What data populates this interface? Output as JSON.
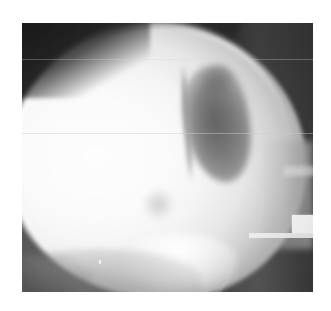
{
  "page": {
    "background_color": "#ffffff",
    "width": 331,
    "height": 311
  },
  "radiograph": {
    "name": "lateral-skull-radiograph",
    "modality": "X-ray",
    "view": "lateral",
    "anatomy": "skull",
    "frame": {
      "left": 22,
      "top": 23,
      "width": 291,
      "height": 269
    },
    "colors": {
      "film_dark": "#3a3a3a",
      "collimation_black": "#1a1a1a",
      "bone_white": "#fdfdfd",
      "lesion_grey": "#6e6e6e",
      "soft_tissue_grey": "#b4b4b4",
      "marker_white": "#f2f2f2"
    },
    "features": [
      {
        "id": "calvarium",
        "label": "Calvarium / cranial vault",
        "description": "Large bright radiopaque dome occupying most of the film"
      },
      {
        "id": "skull-rim",
        "label": "Cortical outer table",
        "description": "Bright curved rim along the superior and anterior skull margin"
      },
      {
        "id": "scalp-line",
        "label": "Scalp soft tissue line",
        "description": "Thin darker line outside the bright cortical rim"
      },
      {
        "id": "lesion",
        "label": "Lucent defect",
        "description": "Prominent dark crescent / leaf shaped lucency in the posterior parietal region"
      },
      {
        "id": "faint-spot",
        "label": "Secondary faint lucency",
        "description": "Small subtle grey spot inferior and anterior to the main lesion"
      },
      {
        "id": "base-arc",
        "label": "Skull base line",
        "description": "Curved dense line crossing the inferior portion of the film"
      },
      {
        "id": "occipital-band",
        "label": "Occipital / collimation band",
        "description": "Dark band running down the right side of the film"
      },
      {
        "id": "marker",
        "label": "Radiographic marker",
        "description": "Bright rectangular lead marker at the right edge"
      }
    ]
  },
  "caption": ""
}
